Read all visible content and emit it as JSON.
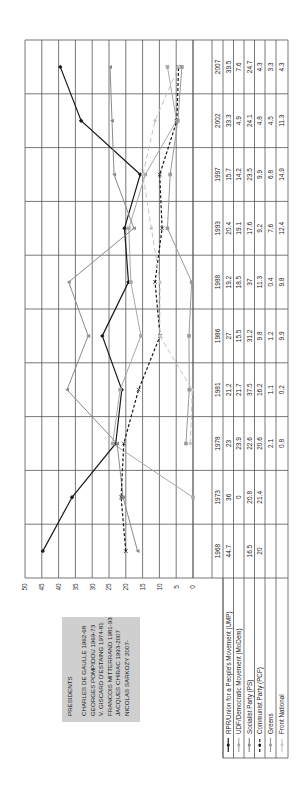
{
  "chart_data": {
    "type": "line",
    "orientation": "rotated-90-ccw",
    "title": "",
    "xlabel": "",
    "ylabel": "",
    "ylim": [
      0,
      50
    ],
    "yticks": [
      0,
      5,
      10,
      15,
      20,
      25,
      30,
      35,
      40,
      45,
      50
    ],
    "grid": true,
    "categories": [
      "1968",
      "1973",
      "1978",
      "1981",
      "1986",
      "1988",
      "1993",
      "1997",
      "2002",
      "2007"
    ],
    "series": [
      {
        "name": "RPR/Union for a People's Movement (UMP)",
        "color": "#1a1a1a",
        "dash": "",
        "marker": "diamond",
        "values": [
          44.7,
          36,
          23,
          21.2,
          27,
          19.2,
          20.4,
          15.7,
          33.3,
          39.5
        ]
      },
      {
        "name": "UDF/Democratic Movement (MoDem)",
        "color": "#a8a8a8",
        "dash": "",
        "marker": "square",
        "values": [
          null,
          0,
          23.9,
          21.7,
          15.5,
          18.5,
          19.1,
          14.2,
          4.9,
          7.6
        ]
      },
      {
        "name": "Socialist Party (PS)",
        "color": "#8a8a8a",
        "dash": "",
        "marker": "triangle",
        "values": [
          16.5,
          20.8,
          22.6,
          37.5,
          31.2,
          37,
          17.6,
          23.5,
          24.1,
          24.7
        ]
      },
      {
        "name": "Communist Party (PCF)",
        "color": "#1a1a1a",
        "dash": "3,2",
        "marker": "x",
        "values": [
          20,
          21.4,
          20.6,
          16.2,
          9.8,
          11.3,
          9.2,
          9.9,
          4.8,
          4.3
        ]
      },
      {
        "name": "Greens",
        "color": "#9a9a9a",
        "dash": "",
        "marker": "square",
        "values": [
          null,
          null,
          2.1,
          1.1,
          1.2,
          0.4,
          7.6,
          6.8,
          4.5,
          3.3
        ]
      },
      {
        "name": "Front National",
        "color": "#c4c4c4",
        "dash": "5,3",
        "marker": "circle",
        "values": [
          null,
          null,
          0.8,
          0.2,
          9.9,
          9.8,
          12.4,
          14.9,
          11.3,
          4.3
        ]
      }
    ],
    "table": {
      "header": [
        "1968",
        "1973",
        "1978",
        "1981",
        "1986",
        "1988",
        "1993",
        "1997",
        "2002",
        "2007"
      ],
      "rows": [
        [
          "44.7",
          "36",
          "23",
          "21.2",
          "27",
          "19.2",
          "20.4",
          "15.7",
          "33.3",
          "39.5"
        ],
        [
          "",
          "0",
          "23.9",
          "21.7",
          "15.5",
          "18.5",
          "19.1",
          "14.2",
          "4.9",
          "7.6"
        ],
        [
          "16.5",
          "20.8",
          "22.6",
          "37.5",
          "31.2",
          "37",
          "17.6",
          "23.5",
          "24.1",
          "24.7"
        ],
        [
          "20",
          "21.4",
          "20.6",
          "16.2",
          "9.8",
          "11.3",
          "9.2",
          "9.9",
          "4.8",
          "4.3"
        ],
        [
          "",
          "",
          "2.1",
          "1.1",
          "1.2",
          "0.4",
          "7.6",
          "6.8",
          "4.5",
          "3.3"
        ],
        [
          "",
          "",
          "0.8",
          "0.2",
          "9.9",
          "9.8",
          "12.4",
          "14.9",
          "11.3",
          "4.3"
        ]
      ]
    },
    "annotation": {
      "title": "PRESIDENTS",
      "lines": [
        "CHARLES DE GAULLE 1962-68",
        "GEORGES POMPIDOU 1969-73",
        "V. GISCARD D'ESTAING 1974-81",
        "FRANCOIS MITTERRAND 1981-93",
        "JACQUES CHIRAC 1993-2007",
        "NICOLAS SARKOZY 2007-"
      ]
    }
  }
}
